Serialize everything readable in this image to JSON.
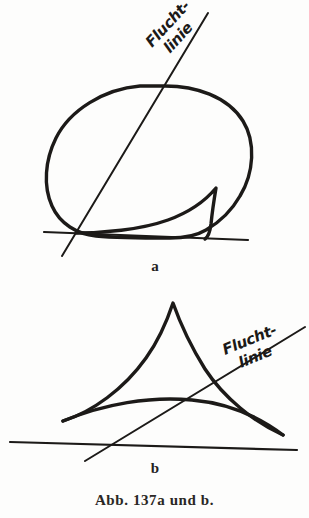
{
  "plate": {
    "caption": "Abb. 137a und b.",
    "background_color": "#fdfdfc",
    "ink_color": "#1c1a18",
    "width": 309,
    "height": 518
  },
  "figures": [
    {
      "id": "a",
      "sub_label": "a",
      "description": "Closed rounded blob outline with a cusp spike at lower right, sitting on a ground line, crossed by a straight vanishing line",
      "annotation": {
        "line1": "Flucht-",
        "line2": "linie",
        "rotation_deg": -47
      },
      "elements": [
        "blob-outline",
        "cusp-spike",
        "ground-line",
        "vanishing-line"
      ]
    },
    {
      "id": "b",
      "sub_label": "b",
      "description": "Cusped triangular shape with two concave sides meeting at an apex and an arched lower curve, above a ground line, crossed by a straight vanishing line",
      "annotation": {
        "line1": "Flucht-",
        "line2": "linie",
        "rotation_deg": -22
      },
      "elements": [
        "cusped-triangle",
        "arched-base-curve",
        "ground-line",
        "vanishing-line"
      ]
    }
  ]
}
